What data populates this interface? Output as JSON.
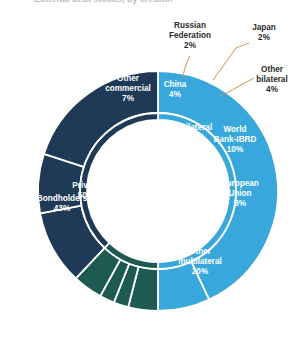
{
  "title_fragment": "External debt stocks, by creditor",
  "colors": {
    "private": "#38a8dc",
    "bilateral": "#1e5a52",
    "multilateral": "#1e3a56",
    "separator": "#ffffff",
    "leader_line": "#c98a42",
    "label_light": "#ffffff",
    "label_dark": "#2b2b2b",
    "background": "#ffffff"
  },
  "chart_data": {
    "type": "pie",
    "variant": "nested-donut",
    "title": "External debt stocks, by creditor",
    "xlabel": "",
    "ylabel": "",
    "legend_position": "none",
    "grid": false,
    "units": "percent",
    "start_angle_deg": 0,
    "direction": "clockwise",
    "rings": [
      {
        "name": "inner",
        "label": "Creditor type",
        "categories": [
          "Private",
          "Bilateral",
          "Multilateral"
        ],
        "values": [
          50,
          12,
          38
        ],
        "colors": [
          "#38a8dc",
          "#1e5a52",
          "#1e3a56"
        ],
        "labels": [
          {
            "name": "Private",
            "value": 50,
            "text": "Private",
            "pct": "50%",
            "color": "#38a8dc",
            "label_color": "#ffffff"
          },
          {
            "name": "Bilateral",
            "value": 12,
            "text": "Bilateral",
            "pct": "12%",
            "color": "#1e5a52",
            "label_color": "#ffffff"
          },
          {
            "name": "Multilateral",
            "value": 38,
            "text": "Multilateral",
            "pct": "38%",
            "color": "#1e3a56",
            "label_color": "#ffffff"
          }
        ]
      },
      {
        "name": "outer",
        "label": "Creditor detail",
        "categories": [
          "Bondholders",
          "Other commercial",
          "China",
          "Russian Federation",
          "Japan",
          "Other bilateral",
          "World Bank-IBRD",
          "European Union",
          "Other multilateral"
        ],
        "values": [
          43,
          7,
          4,
          2,
          2,
          4,
          10,
          8,
          20
        ],
        "colors": [
          "#38a8dc",
          "#38a8dc",
          "#1e5a52",
          "#1e5a52",
          "#1e5a52",
          "#1e5a52",
          "#1e3a56",
          "#1e3a56",
          "#1e3a56"
        ],
        "labels": [
          {
            "name": "Bondholders",
            "value": 43,
            "line1": "Bondholders",
            "line2": "43%",
            "placement": "inside",
            "color": "#38a8dc",
            "label_color": "#ffffff"
          },
          {
            "name": "Other commercial",
            "value": 7,
            "line1": "Other",
            "line2": "commercial",
            "line3": "7%",
            "placement": "inside",
            "color": "#38a8dc",
            "label_color": "#ffffff"
          },
          {
            "name": "China",
            "value": 4,
            "line1": "China",
            "line2": "4%",
            "placement": "inside",
            "color": "#1e5a52",
            "label_color": "#ffffff"
          },
          {
            "name": "Russian Federation",
            "value": 2,
            "line1": "Russian",
            "line2": "Federation",
            "line3": "2%",
            "placement": "callout",
            "color": "#1e5a52",
            "label_color": "#2b2b2b"
          },
          {
            "name": "Japan",
            "value": 2,
            "line1": "Japan",
            "line2": "2%",
            "placement": "callout",
            "color": "#1e5a52",
            "label_color": "#2b2b2b"
          },
          {
            "name": "Other bilateral",
            "value": 4,
            "line1": "Other",
            "line2": "bilateral",
            "line3": "4%",
            "placement": "callout",
            "color": "#1e5a52",
            "label_color": "#2b2b2b"
          },
          {
            "name": "World Bank-IBRD",
            "value": 10,
            "line1": "World",
            "line2": "Bank-IBRD",
            "line3": "10%",
            "placement": "inside",
            "color": "#1e3a56",
            "label_color": "#ffffff"
          },
          {
            "name": "European Union",
            "value": 8,
            "line1": "European",
            "line2": "Union",
            "line3": "8%",
            "placement": "inside",
            "color": "#1e3a56",
            "label_color": "#ffffff"
          },
          {
            "name": "Other multilateral",
            "value": 20,
            "line1": "Other",
            "line2": "multilateral",
            "line3": "20%",
            "placement": "inside",
            "color": "#1e3a56",
            "label_color": "#ffffff"
          }
        ]
      }
    ]
  }
}
